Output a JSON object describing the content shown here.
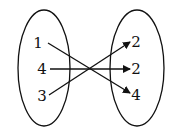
{
  "domain_values": [
    "1",
    "4",
    "3"
  ],
  "range_values": [
    "2",
    "2",
    "4"
  ],
  "mappings": [
    {
      "from": 0,
      "to": 2
    },
    {
      "from": 1,
      "to": 1
    },
    {
      "from": 2,
      "to": 0
    }
  ]
}
